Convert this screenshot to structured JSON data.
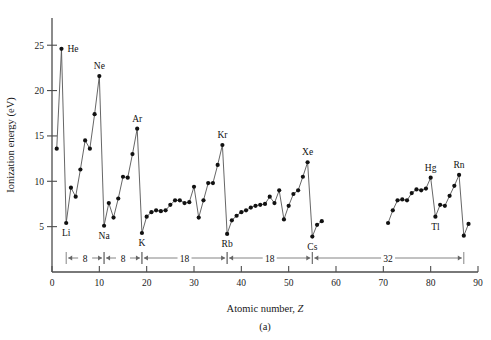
{
  "chart_data": {
    "type": "line",
    "title": "",
    "subtitle": "",
    "xlabel": "Atomic number, Z",
    "ylabel": "Ionization energy (eV)",
    "figure_label": "(a)",
    "xlim": [
      0,
      90
    ],
    "ylim": [
      0,
      28
    ],
    "xticks": [
      0,
      10,
      20,
      30,
      40,
      50,
      60,
      70,
      80,
      90
    ],
    "xtick_labels": [
      "0",
      "10",
      "20",
      "30",
      "40",
      "50",
      "60",
      "70",
      "80",
      "90"
    ],
    "yticks": [
      5,
      10,
      15,
      20,
      25
    ],
    "ytick_labels": [
      "5",
      "10",
      "15",
      "20",
      "25"
    ],
    "grid": false,
    "legend": "none",
    "marker": "filled-circle",
    "series": [
      {
        "name": "First ionization energy",
        "x": [
          1,
          2,
          3,
          4,
          5,
          6,
          7,
          8,
          9,
          10,
          11,
          12,
          13,
          14,
          15,
          16,
          17,
          18,
          19,
          20,
          21,
          22,
          23,
          24,
          25,
          26,
          27,
          28,
          29,
          30,
          31,
          32,
          33,
          34,
          35,
          36,
          37,
          38,
          39,
          40,
          41,
          42,
          43,
          44,
          45,
          46,
          47,
          48,
          49,
          50,
          51,
          52,
          53,
          54,
          55,
          56,
          57
        ],
        "values": [
          13.6,
          24.6,
          5.4,
          9.3,
          8.3,
          11.3,
          14.5,
          13.6,
          17.4,
          21.6,
          5.1,
          7.6,
          6.0,
          8.1,
          10.5,
          10.4,
          13.0,
          15.8,
          4.3,
          6.1,
          6.6,
          6.8,
          6.7,
          6.8,
          7.4,
          7.9,
          7.9,
          7.6,
          7.7,
          9.4,
          6.0,
          7.9,
          9.8,
          9.8,
          11.8,
          14.0,
          4.2,
          5.7,
          6.2,
          6.6,
          6.8,
          7.1,
          7.3,
          7.4,
          7.5,
          8.3,
          7.6,
          9.0,
          5.8,
          7.3,
          8.6,
          9.0,
          10.5,
          12.1,
          3.9,
          5.2,
          5.6
        ]
      },
      {
        "name": "First ionization energy (continued)",
        "x": [
          71,
          72,
          73,
          74,
          75,
          76,
          77,
          78,
          79,
          80,
          81,
          82,
          83,
          84,
          85,
          86,
          87,
          88
        ],
        "values": [
          5.4,
          6.8,
          7.9,
          8.0,
          7.9,
          8.7,
          9.1,
          9.0,
          9.2,
          10.4,
          6.1,
          7.4,
          7.3,
          8.4,
          9.5,
          10.7,
          4.0,
          5.3
        ]
      }
    ],
    "point_labels": [
      {
        "element": "He",
        "z": 2,
        "value": 24.6,
        "position": "right"
      },
      {
        "element": "Ne",
        "z": 10,
        "value": 21.6,
        "position": "above"
      },
      {
        "element": "Ar",
        "z": 18,
        "value": 15.8,
        "position": "above"
      },
      {
        "element": "Kr",
        "z": 36,
        "value": 14.0,
        "position": "above"
      },
      {
        "element": "Xe",
        "z": 54,
        "value": 12.1,
        "position": "above"
      },
      {
        "element": "Rn",
        "z": 86,
        "value": 10.7,
        "position": "above"
      },
      {
        "element": "Hg",
        "z": 80,
        "value": 10.4,
        "position": "above"
      },
      {
        "element": "Li",
        "z": 3,
        "value": 5.4,
        "position": "below"
      },
      {
        "element": "Na",
        "z": 11,
        "value": 5.1,
        "position": "below"
      },
      {
        "element": "K",
        "z": 19,
        "value": 4.3,
        "position": "below"
      },
      {
        "element": "Rb",
        "z": 37,
        "value": 4.2,
        "position": "below"
      },
      {
        "element": "Cs",
        "z": 55,
        "value": 3.9,
        "position": "below"
      },
      {
        "element": "Tl",
        "z": 81,
        "value": 6.1,
        "position": "below"
      }
    ],
    "period_brackets": [
      {
        "label": "8",
        "start": 3,
        "end": 11
      },
      {
        "label": "8",
        "start": 11,
        "end": 19
      },
      {
        "label": "18",
        "start": 19,
        "end": 37
      },
      {
        "label": "18",
        "start": 37,
        "end": 55
      },
      {
        "label": "32",
        "start": 55,
        "end": 87
      }
    ]
  }
}
